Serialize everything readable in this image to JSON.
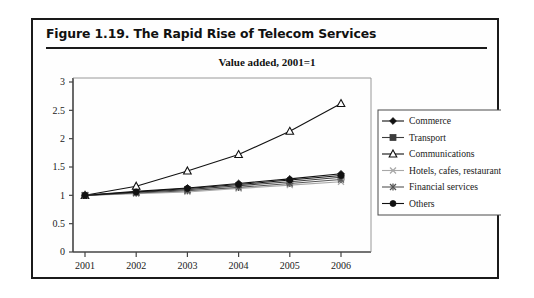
{
  "figure": {
    "title": "Figure 1.19.  The Rapid Rise of Telecom Services"
  },
  "chart_data": {
    "type": "line",
    "title": "Value added, 2001=1",
    "xlabel": "",
    "ylabel": "",
    "categories": [
      "2001",
      "2002",
      "2003",
      "2004",
      "2005",
      "2006"
    ],
    "x": [
      2001,
      2002,
      2003,
      2004,
      2005,
      2006
    ],
    "ylim": [
      0,
      3
    ],
    "yticks": [
      "0",
      "0.5",
      "1",
      "1.5",
      "2",
      "2.5",
      "3"
    ],
    "ytick_values": [
      0,
      0.5,
      1,
      1.5,
      2,
      2.5,
      3
    ],
    "grid": false,
    "legend_position": "right",
    "series": [
      {
        "name": "Commerce",
        "marker": "diamond",
        "color": "#111111",
        "values": [
          1.0,
          1.07,
          1.13,
          1.21,
          1.29,
          1.38
        ]
      },
      {
        "name": "Transport",
        "marker": "square",
        "color": "#3d3d3d",
        "values": [
          1.0,
          1.05,
          1.1,
          1.17,
          1.24,
          1.32
        ]
      },
      {
        "name": "Communications",
        "marker": "triangle-open",
        "color": "#111111",
        "values": [
          1.0,
          1.16,
          1.43,
          1.72,
          2.13,
          2.62
        ]
      },
      {
        "name": "Hotels, cafes, restaurants",
        "marker": "x",
        "color": "#a8a8a8",
        "values": [
          1.0,
          1.03,
          1.06,
          1.12,
          1.18,
          1.24
        ]
      },
      {
        "name": "Financial services",
        "marker": "star",
        "color": "#555555",
        "values": [
          1.0,
          1.04,
          1.08,
          1.14,
          1.21,
          1.28
        ]
      },
      {
        "name": "Others",
        "marker": "circle",
        "color": "#111111",
        "values": [
          1.0,
          1.06,
          1.12,
          1.19,
          1.27,
          1.35
        ]
      }
    ]
  }
}
